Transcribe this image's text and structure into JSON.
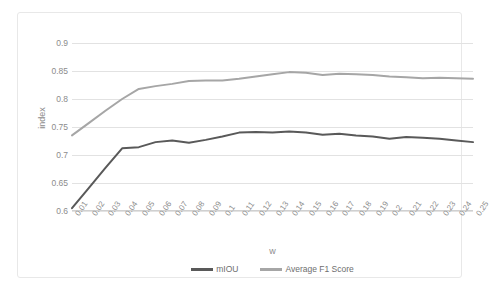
{
  "chart_data": {
    "type": "line",
    "title": "",
    "xlabel": "w",
    "ylabel": "index",
    "ylim": [
      0.6,
      0.9
    ],
    "yticks": [
      "0.6",
      "0.65",
      "0.7",
      "0.75",
      "0.8",
      "0.85",
      "0.9"
    ],
    "ytick_values": [
      0.6,
      0.65,
      0.7,
      0.75,
      0.8,
      0.85,
      0.9
    ],
    "grid": true,
    "legend_position": "bottom",
    "categories": [
      "0.01",
      "0.02",
      "0.03",
      "0.04",
      "0.05",
      "0.06",
      "0.07",
      "0.08",
      "0.09",
      "0.1",
      "0.11",
      "0.12",
      "0.13",
      "0.14",
      "0.15",
      "0.16",
      "0.17",
      "0.18",
      "0.19",
      "0.2",
      "0.21",
      "0.22",
      "0.23",
      "0.24",
      "0.25"
    ],
    "series": [
      {
        "name": "mIOU",
        "color": "#595959",
        "values": [
          0.605,
          0.641,
          0.677,
          0.712,
          0.714,
          0.723,
          0.726,
          0.722,
          0.727,
          0.733,
          0.74,
          0.741,
          0.74,
          0.742,
          0.74,
          0.736,
          0.738,
          0.735,
          0.733,
          0.729,
          0.732,
          0.731,
          0.729,
          0.726,
          0.723
        ]
      },
      {
        "name": "Average F1 Score",
        "color": "#a6a6a6",
        "values": [
          0.735,
          0.757,
          0.779,
          0.8,
          0.818,
          0.823,
          0.827,
          0.832,
          0.833,
          0.833,
          0.836,
          0.84,
          0.844,
          0.848,
          0.847,
          0.843,
          0.845,
          0.844,
          0.843,
          0.84,
          0.839,
          0.837,
          0.838,
          0.837,
          0.836
        ]
      }
    ]
  },
  "legend": {
    "items": [
      {
        "label": "mIOU",
        "color": "#595959"
      },
      {
        "label": "Average F1 Score",
        "color": "#a6a6a6"
      }
    ]
  },
  "colors": {
    "grid": "#e2e2e2",
    "axis": "#d0d0d0",
    "text": "#8c8c8c",
    "frame": "#e8e8e8",
    "background": "#ffffff"
  }
}
